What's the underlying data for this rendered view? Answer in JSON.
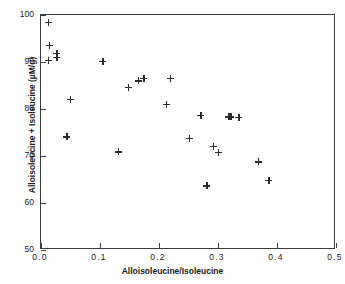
{
  "chart_data": {
    "type": "scatter",
    "title": "",
    "xlabel": "Alloisoleucine/Isoleucine",
    "ylabel": "Alloisoleucine + Isoleucine (µM/g)",
    "xlim": [
      0.0,
      0.5
    ],
    "ylim": [
      50,
      100
    ],
    "xticks": [
      "0.0",
      "0.1",
      "0.2",
      "0.3",
      "0.4",
      "0.5"
    ],
    "xtick_values": [
      0.0,
      0.1,
      0.2,
      0.3,
      0.4,
      0.5
    ],
    "yticks": [
      "50",
      "60",
      "70",
      "80",
      "90",
      "100"
    ],
    "ytick_values": [
      50,
      60,
      70,
      80,
      90,
      100
    ],
    "grid": false,
    "legend": null,
    "marker": "plus",
    "marker_color": "#2b2b2b",
    "series": [
      {
        "name": "samples",
        "points": [
          {
            "x": 0.012,
            "y": 98.5
          },
          {
            "x": 0.014,
            "y": 93.5
          },
          {
            "x": 0.012,
            "y": 90.3
          },
          {
            "x": 0.027,
            "y": 91.8
          },
          {
            "x": 0.027,
            "y": 91.0
          },
          {
            "x": 0.05,
            "y": 82.1
          },
          {
            "x": 0.044,
            "y": 74.1
          },
          {
            "x": 0.105,
            "y": 90.1
          },
          {
            "x": 0.131,
            "y": 70.9
          },
          {
            "x": 0.148,
            "y": 84.6
          },
          {
            "x": 0.165,
            "y": 86.0
          },
          {
            "x": 0.174,
            "y": 86.5
          },
          {
            "x": 0.212,
            "y": 81.0
          },
          {
            "x": 0.219,
            "y": 86.5
          },
          {
            "x": 0.251,
            "y": 73.8
          },
          {
            "x": 0.271,
            "y": 78.6
          },
          {
            "x": 0.281,
            "y": 63.7
          },
          {
            "x": 0.292,
            "y": 72.1
          },
          {
            "x": 0.3,
            "y": 70.8
          },
          {
            "x": 0.318,
            "y": 78.3
          },
          {
            "x": 0.322,
            "y": 78.3
          },
          {
            "x": 0.335,
            "y": 78.2
          },
          {
            "x": 0.368,
            "y": 68.8
          },
          {
            "x": 0.386,
            "y": 64.8
          }
        ]
      }
    ]
  }
}
